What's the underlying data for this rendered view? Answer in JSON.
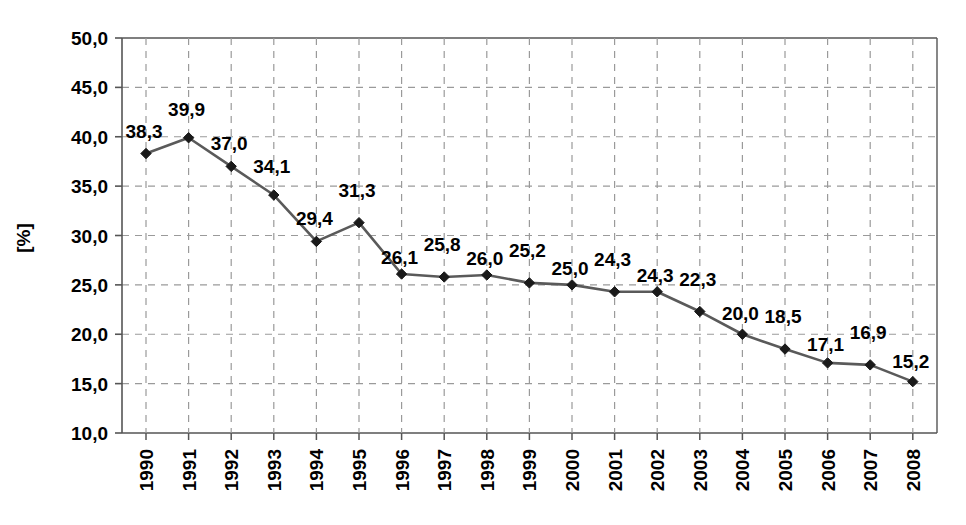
{
  "chart_data": {
    "type": "line",
    "title": "",
    "subtitle": "",
    "xlabel": "",
    "ylabel": "[%]",
    "categories": [
      "1990",
      "1991",
      "1992",
      "1993",
      "1994",
      "1995",
      "1996",
      "1997",
      "1998",
      "1999",
      "2000",
      "2001",
      "2002",
      "2003",
      "2004",
      "2005",
      "2006",
      "2007",
      "2008"
    ],
    "values": [
      38.3,
      39.9,
      37.0,
      34.1,
      29.4,
      31.3,
      26.1,
      25.8,
      26.0,
      25.2,
      25.0,
      24.3,
      24.3,
      22.3,
      20.0,
      18.5,
      17.1,
      16.9,
      15.2
    ],
    "point_labels": [
      "38,3",
      "39,9",
      "37,0",
      "34,1",
      "29,4",
      "31,3",
      "26,1",
      "25,8",
      "26,0",
      "25,2",
      "25,0",
      "24,3",
      "24,3",
      "22,3",
      "20,0",
      "18,5",
      "17,1",
      "16,9",
      "15,2"
    ],
    "ylim": [
      10.0,
      50.0
    ],
    "ytick_values": [
      50.0,
      45.0,
      40.0,
      35.0,
      30.0,
      25.0,
      20.0,
      15.0,
      10.0
    ],
    "ytick_labels": [
      "50,0",
      "45,0",
      "40,0",
      "35,0",
      "30,0",
      "25,0",
      "20,0",
      "15,0",
      "10,0"
    ],
    "grid": "both-dashed",
    "legend": "none",
    "decimal_separator": ",",
    "series": [
      {
        "name": "series-1",
        "values": [
          38.3,
          39.9,
          37.0,
          34.1,
          29.4,
          31.3,
          26.1,
          25.8,
          26.0,
          25.2,
          25.0,
          24.3,
          24.3,
          22.3,
          20.0,
          18.5,
          17.1,
          16.9,
          15.2
        ],
        "marker": "diamond",
        "line_color": "#5a5a5a",
        "marker_color": "#1a1a1a"
      }
    ],
    "colors": {
      "background": "#ffffff",
      "axis": "#555555",
      "grid": "#9a9a9a",
      "line": "#5a5a5a",
      "marker": "#1a1a1a",
      "text": "#000000"
    },
    "label_offsets_dy": [
      -16,
      -22,
      -16,
      -22,
      -16,
      -26,
      -10,
      -26,
      -10,
      -26,
      -10,
      -26,
      -10,
      -26,
      -14,
      -26,
      -12,
      -26,
      -14
    ]
  }
}
